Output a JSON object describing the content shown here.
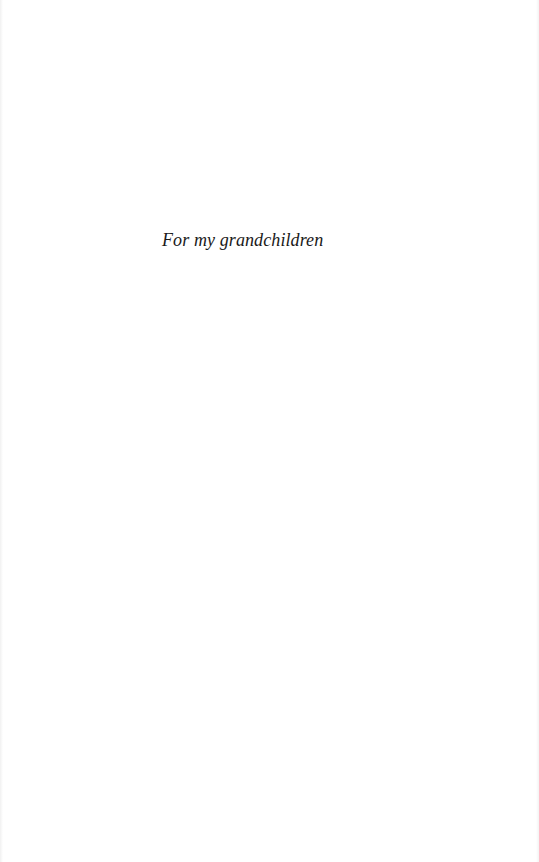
{
  "page": {
    "background": "#ffffff",
    "text_color": "#1a1a1a"
  },
  "dedication": {
    "text": "For my grandchildren"
  }
}
